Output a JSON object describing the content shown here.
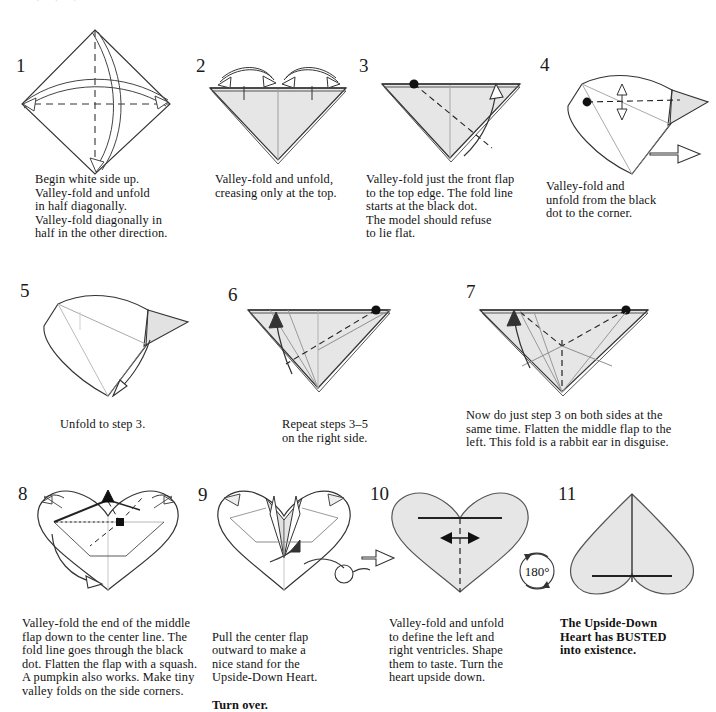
{
  "document": {
    "title": "The Upside-Down Heart",
    "type": "origami-instruction-diagram",
    "top_partial_line": "· · ·"
  },
  "palette": {
    "paper_fill": "#e6e6e6",
    "paper_fill_light": "#f2f2f2",
    "white_fill": "#ffffff",
    "line": "#333333",
    "line_soft": "#8a8a8a",
    "dot": "#111111",
    "text": "#121212"
  },
  "steps": [
    {
      "number": "1",
      "caption": "Begin white side up.\nValley-fold and unfold\nin half diagonally.\nValley-fold diagonally in\nhalf in the other direction.",
      "bold": false,
      "figure": "square-on-point-with-two-diagonal-creases"
    },
    {
      "number": "2",
      "caption": "Valley-fold and unfold,\ncreasing only at the top.",
      "bold": false,
      "figure": "downward-triangle-with-two-top-creases"
    },
    {
      "number": "3",
      "caption": "Valley-fold just the front flap\nto the top edge.  The fold line\nstarts at the black dot.\nThe model should refuse\nto lie flat.",
      "bold": false,
      "figure": "triangle-with-dashed-fold-from-dot"
    },
    {
      "number": "4",
      "caption": "Valley-fold and\nunfold from the black\ndot to the corner.",
      "bold": false,
      "figure": "three-dimensional-cone-with-dashed-crease"
    },
    {
      "number": "5",
      "caption": "Unfold to step 3.",
      "bold": false,
      "figure": "three-dimensional-cone-with-unfold-arrow"
    },
    {
      "number": "6",
      "caption": "Repeat steps 3–5\non the right side.",
      "bold": false,
      "figure": "triangle-mirrored-fold-right-side"
    },
    {
      "number": "7",
      "caption": "Now do just step 3 on both sides at the\nsame time.  Flatten the middle flap to the\nleft.  This fold is a rabbit ear in disguise.",
      "bold": false,
      "figure": "triangle-with-two-dots-and-center-crease"
    },
    {
      "number": "8",
      "caption": "Valley-fold the end of the middle\nflap down to the center line.  The\nfold line goes through the black\ndot.  Flatten the flap with a squash.\nA pumpkin also works.  Make tiny\nvalley folds on the side corners.",
      "bold": false,
      "figure": "heart-outline-with-squash-fold"
    },
    {
      "number": "9",
      "caption": "Pull the center flap\noutward to make a\nnice stand for the\nUpside-Down Heart.\nTurn over.",
      "bold": false,
      "bold_tail": "Turn over.",
      "figure": "heart-with-center-flap-pull"
    },
    {
      "number": "10",
      "caption": "Valley-fold and unfold\nto define the left and\nright ventricles.  Shape\nthem to taste.  Turn the\nheart upside down.",
      "bold": false,
      "figure": "shaded-heart-with-vertical-crease"
    },
    {
      "number": "11",
      "caption": "The Upside-Down\nHeart has BUSTED\ninto existence.",
      "bold": true,
      "figure": "finished-upside-down-heart"
    }
  ],
  "symbols": {
    "turn_over_label": "",
    "rotate_label": "180°",
    "push_arrow": "push-arrow",
    "turnover_loop": "turn-over-loop"
  }
}
